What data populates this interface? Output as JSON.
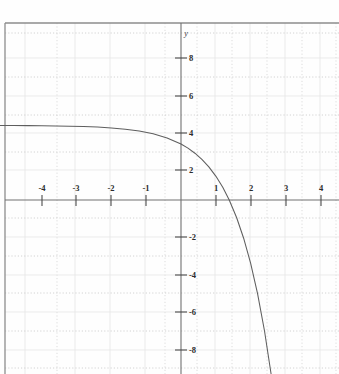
{
  "header": {
    "problem_number": "15.",
    "function_label": "f (x) = -e",
    "exponent": "x",
    "function_tail": "+ 4",
    "full_title": "15. f(x) = -e^x + 4"
  },
  "chart_data": {
    "type": "line",
    "xlabel": "",
    "ylabel": "y",
    "y_axis_label": "y",
    "xlim": [
      -5.2,
      4.55
    ],
    "ylim": [
      -9.5,
      10.8
    ],
    "grid": true,
    "grid_color": "#d8d8d8",
    "axis_color": "#6b6b6b",
    "curve_color": "#5a5a5a",
    "background": "#fefefe",
    "xticks": [
      -4,
      -3,
      -2,
      -1,
      1,
      2,
      3,
      4
    ],
    "xtick_labels": [
      "-4",
      "-3",
      "-2",
      "-1",
      "1",
      "2",
      "3",
      "4"
    ],
    "yticks": [
      8,
      6,
      4,
      2,
      -2,
      -4,
      -6,
      -8
    ],
    "ytick_labels": [
      "8",
      "6",
      "4",
      "2",
      "-2",
      "-4",
      "-6",
      "-8"
    ],
    "series": [
      {
        "name": "f(x) = -e^x + 4",
        "equation": "y = -exp(x) + 4",
        "asymptote": 4,
        "x_intercept": 1.386,
        "y_intercept": 3,
        "x": [
          -5.2,
          -4.8,
          -4.4,
          -4.0,
          -3.6,
          -3.2,
          -2.8,
          -2.4,
          -2.0,
          -1.6,
          -1.2,
          -0.8,
          -0.4,
          0.0,
          0.2,
          0.4,
          0.6,
          0.8,
          1.0,
          1.2,
          1.386,
          1.6,
          1.8,
          2.0,
          2.2,
          2.4,
          2.6
        ],
        "y": [
          3.994,
          3.992,
          3.988,
          3.982,
          3.973,
          3.959,
          3.939,
          3.909,
          3.865,
          3.798,
          3.699,
          3.551,
          3.33,
          3.0,
          2.779,
          2.508,
          2.178,
          1.774,
          1.282,
          0.68,
          0.0,
          -0.953,
          -2.05,
          -3.389,
          -5.025,
          -7.023,
          -9.464
        ]
      }
    ]
  },
  "figure": {
    "frame_left_border": true,
    "frame_top_border": true
  }
}
